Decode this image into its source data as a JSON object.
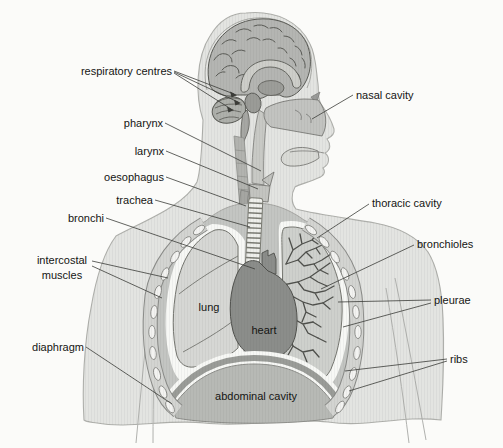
{
  "canvas": {
    "width": 503,
    "height": 448
  },
  "labels": {
    "respiratory_centres": "respiratory centres",
    "nasal_cavity": "nasal cavity",
    "pharynx": "pharynx",
    "larynx": "larynx",
    "oesophagus": "oesophagus",
    "trachea": "trachea",
    "bronchi": "bronchi",
    "thoracic_cavity": "thoracic cavity",
    "bronchioles": "bronchioles",
    "intercostal_line1": "intercostal",
    "intercostal_line2": "muscles",
    "lung": "lung",
    "pleurae": "pleurae",
    "heart": "heart",
    "diaphragm": "diaphragm",
    "ribs": "ribs",
    "abdominal_cavity": "abdominal cavity"
  },
  "colors": {
    "background": "#fbfbf9",
    "body": "#e3e4e1",
    "body_outline": "#aeafab",
    "thoracic_cavity": "#c3c5c2",
    "chest_band": "#d3d4d1",
    "band_edge": "#8b8c89",
    "rib": "#f3f3f1",
    "lung_left": "#d6d7d4",
    "lung_right": "#ced0cc",
    "bronchiole_tree": "#4f504c",
    "heart": "#8b8d8a",
    "abdomen": "#b7b9b5",
    "diaphragm_band": "#9a9c98",
    "pleura_white": "#f7f8f5",
    "brain": "#b4b5b2",
    "corpus_callosum": "#cdcec9",
    "nasal": "#c2c3c0",
    "trachea_fill": "#eeefeb",
    "leader_line": "#3b3c38",
    "label_text": "#151513"
  }
}
